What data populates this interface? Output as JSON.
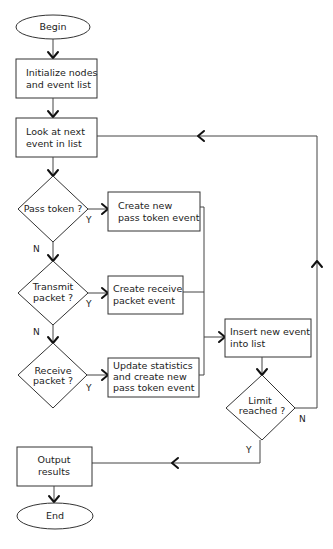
{
  "diagram": {
    "type": "flowchart",
    "nodes": {
      "begin": {
        "label": "Begin"
      },
      "init": {
        "line1": "Initialize nodes",
        "line2": "and event list"
      },
      "look": {
        "line1": "Look at next",
        "line2": "event in list"
      },
      "pass_token": {
        "line1": "Pass token ?"
      },
      "create_pass": {
        "line1": "Create new",
        "line2": "pass token event"
      },
      "transmit": {
        "line1": "Transmit",
        "line2": "packet ?"
      },
      "create_receive": {
        "line1": "Create receive",
        "line2": "packet event"
      },
      "receive": {
        "line1": "Receive",
        "line2": "packet ?"
      },
      "update_stats": {
        "line1": "Update statistics",
        "line2": "and create new",
        "line3": "pass token event"
      },
      "insert": {
        "line1": "Insert new event",
        "line2": "into list"
      },
      "limit": {
        "line1": "Limit",
        "line2": "reached ?"
      },
      "output": {
        "line1": "Output",
        "line2": "results"
      },
      "end": {
        "label": "End"
      }
    },
    "edge_labels": {
      "pass_yes": "Y",
      "pass_no": "N",
      "transmit_yes": "Y",
      "transmit_no": "N",
      "receive_yes": "Y",
      "limit_no": "N",
      "limit_yes": "Y"
    }
  }
}
